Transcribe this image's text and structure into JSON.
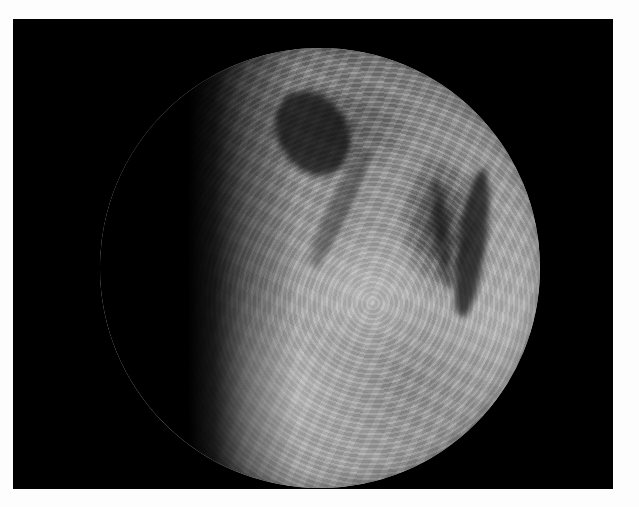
{
  "image": {
    "description": "Grayscale circular microscopic (endomicroscopy-style) field of view showing tissue texture on a black background with a white border",
    "colors": {
      "page_background": "#fdfdfd",
      "frame_background": "#000000",
      "tissue_mid_tone": "#9c9c9c",
      "tissue_dark": "#1a1a1a",
      "tissue_light": "#d2d2d2"
    }
  }
}
